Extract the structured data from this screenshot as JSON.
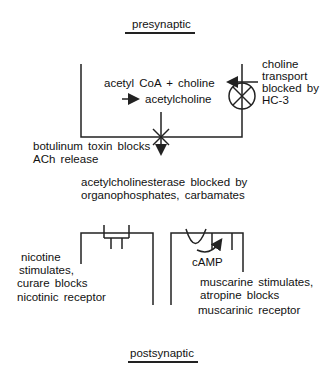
{
  "diagram": {
    "title_top": "presynaptic",
    "title_bottom": "postsynaptic",
    "synthesis": {
      "line1": "acetyl  CoA  +  choline",
      "line2": "acetylcholine"
    },
    "choline_transport": {
      "line1": "choline",
      "line2": "transport",
      "line3": "blocked  by",
      "line4": "HC-3"
    },
    "botulinum": {
      "line1": "botulinum  toxin  blocks",
      "line2": "ACh  release"
    },
    "acetylcholinesterase": {
      "line1": "acetylcholinesterase  blocked  by",
      "line2": "organophosphates,  carbamates"
    },
    "nicotinic": {
      "line1": "nicotine",
      "line2": "stimulates,",
      "line3": "curare  blocks",
      "line4": "nicotinic  receptor"
    },
    "muscarinic": {
      "camp": "cAMP",
      "line1": "muscarine  stimulates,",
      "line2": "atropine  blocks",
      "line3": "muscarinic  receptor"
    },
    "colors": {
      "line": "#222222",
      "background": "#ffffff"
    }
  }
}
